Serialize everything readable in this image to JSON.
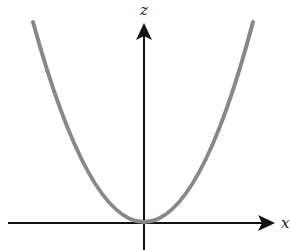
{
  "diagram": {
    "type": "parabola-plot",
    "curve": {
      "equation": "z = x^2",
      "color": "#888888",
      "stroke_width": 4
    },
    "axes": {
      "horizontal": {
        "label": "x",
        "color": "#111111"
      },
      "vertical": {
        "label": "z",
        "color": "#111111"
      }
    }
  }
}
